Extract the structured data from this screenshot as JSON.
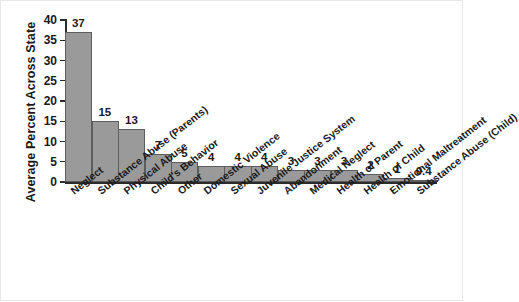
{
  "chart_data": {
    "type": "bar",
    "title": "",
    "xlabel": "",
    "ylabel": "Average Percent Across State",
    "ylim": [
      0,
      40
    ],
    "yticks": [
      0,
      5,
      10,
      15,
      20,
      25,
      30,
      35,
      40
    ],
    "grid": false,
    "legend": null,
    "bar_color": "#9a9a9a",
    "bar_edge_color": "#5d5d5d",
    "axis_color": "#2b2b2b",
    "categories": [
      "Neglect",
      "Substance Abuse (Parents)",
      "Physical Abuse",
      "Child's Behavior",
      "Other",
      "Domestic Violence",
      "Sexual Abuse",
      "Juvenile Justice System",
      "Abandonment",
      "Medical Neglect",
      "Health of Parent",
      "Health of Child",
      "Emotional Maltreatment",
      "Substance Abuse (Child)"
    ],
    "values": [
      37,
      15,
      13,
      7,
      5,
      4,
      4,
      4,
      3,
      3,
      3,
      2,
      1,
      0.4
    ],
    "value_labels": [
      "37",
      "15",
      "13",
      "7",
      "5",
      "4",
      "4",
      "4",
      "3",
      "3",
      "3",
      "2",
      "1",
      "0.4"
    ]
  }
}
